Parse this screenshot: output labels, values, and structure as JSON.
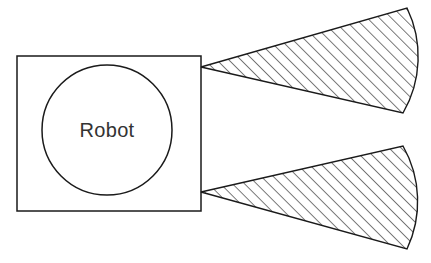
{
  "figure": {
    "background_color": "#ffffff",
    "line_color": "#1a1a1a",
    "width": 431,
    "height": 263
  },
  "robot": {
    "label": "Robot",
    "label_color": "#333333",
    "body": {
      "shape": "square",
      "x": 17,
      "y": 56,
      "width": 184,
      "height": 155,
      "fill": "#ffffff"
    },
    "core": {
      "shape": "circle",
      "cx": 107,
      "cy": 130,
      "r": 65,
      "fill": "#ffffff"
    }
  },
  "cones": [
    {
      "name": "upper-cone",
      "apex_x": 201,
      "apex_y": 67,
      "top_corner_x": 407,
      "top_corner_y": 8,
      "bottom_corner_x": 403,
      "bottom_corner_y": 113,
      "arc_bulge_x": 421,
      "fill": "hatched",
      "hatch_angle_deg": 45,
      "hatch_spacing": 8.5
    },
    {
      "name": "lower-cone",
      "apex_x": 201,
      "apex_y": 192,
      "top_corner_x": 403,
      "top_corner_y": 146,
      "bottom_corner_x": 407,
      "bottom_corner_y": 249,
      "arc_bulge_x": 420,
      "fill": "hatched",
      "hatch_angle_deg": 45,
      "hatch_spacing": 8.5
    }
  ]
}
